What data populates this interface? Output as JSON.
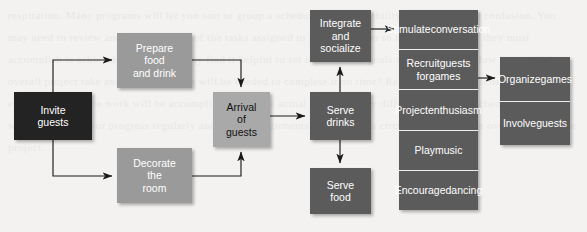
{
  "diagram": {
    "type": "flowchart",
    "canvas": {
      "width": 587,
      "height": 232,
      "background": "#f3f2f0"
    },
    "palette": {
      "near_black": "#232323",
      "medium_gray": "#9a9a9a",
      "light_gray": "#a9a9a9",
      "dark_gray": "#5b5b5b",
      "white_text": "#ffffff",
      "black_text": "#111111",
      "divider": "#efefef",
      "arrow": "#1a1a1a"
    },
    "background_bleed_text": "respiration. Many programs will let you sort or group a schedule by responsibility. This is to avoid confusion. You may need to review and coordinate all of the tasks assigned to a given person so that the work that they must accomplish is achievable. Also, you may find it helpful to set intermediate goals and milestones. How long will the overall project take and what resources will be needed to complete it on time? Remember that the schedule is only an estimate of how the work will be accomplished, and the actual sequence may differ. To make the schedule work, you will need to monitor progress regularly and adjust assignments and timing as circumstances change over the life of the project.",
    "nodes": [
      {
        "id": "invite-guests",
        "label": "Invite\nguests",
        "style": "near_black",
        "text": "white",
        "x": 14,
        "y": 92,
        "w": 78,
        "h": 48
      },
      {
        "id": "prepare-food",
        "label": "Prepare\nfood\nand drink",
        "style": "medium_gray",
        "text": "white",
        "x": 117,
        "y": 33,
        "w": 75,
        "h": 55
      },
      {
        "id": "decorate-room",
        "label": "Decorate\nthe\nroom",
        "style": "medium_gray",
        "text": "white",
        "x": 117,
        "y": 148,
        "w": 75,
        "h": 55
      },
      {
        "id": "arrival-of-guests",
        "label": "Arrival\nof\nguests",
        "style": "light_gray",
        "text": "black",
        "x": 213,
        "y": 92,
        "w": 57,
        "h": 55
      },
      {
        "id": "integrate-socialize",
        "label": "Integrate\nand\nsocialize",
        "style": "dark_gray",
        "text": "white",
        "x": 310,
        "y": 10,
        "w": 61,
        "h": 52
      },
      {
        "id": "serve-drinks",
        "label": "Serve\ndrinks",
        "style": "dark_gray",
        "text": "white",
        "x": 310,
        "y": 92,
        "w": 61,
        "h": 48
      },
      {
        "id": "serve-food",
        "label": "Serve\nfood",
        "style": "dark_gray",
        "text": "white",
        "x": 310,
        "y": 168,
        "w": 61,
        "h": 46
      }
    ],
    "stacks": [
      {
        "id": "socialize-tactics",
        "style": "dark_gray",
        "x": 399,
        "y": 10,
        "w": 79,
        "h": 200,
        "cells": [
          {
            "id": "stimulate-conversation",
            "label": "Stimulate\nconversation"
          },
          {
            "id": "recruit-guests-games",
            "label": "Recruit\nguests for\ngames"
          },
          {
            "id": "project-enthusiasm",
            "label": "Project\nenthusiasm"
          },
          {
            "id": "play-music",
            "label": "Play\nmusic"
          },
          {
            "id": "encourage-dancing",
            "label": "Encourage\ndancing"
          }
        ]
      },
      {
        "id": "games-tactics",
        "style": "dark_gray",
        "x": 500,
        "y": 57,
        "w": 70,
        "h": 88,
        "cells": [
          {
            "id": "organize-games",
            "label": "Organize\ngames"
          },
          {
            "id": "involve-guests",
            "label": "Involve\nguests"
          }
        ]
      }
    ],
    "connectors": [
      {
        "id": "invite-to-prepare",
        "from": "invite-guests",
        "to": "prepare-food",
        "path": "M 53 92 L 53 60 L 112 60",
        "arrow": "right"
      },
      {
        "id": "invite-to-decorate",
        "from": "invite-guests",
        "to": "decorate-room",
        "path": "M 53 140 L 53 176 L 112 176",
        "arrow": "right"
      },
      {
        "id": "prepare-to-arrival",
        "from": "prepare-food",
        "to": "arrival-of-guests",
        "path": "M 192 60 L 241 60 L 241 87",
        "arrow": "down"
      },
      {
        "id": "decorate-to-arrival",
        "from": "decorate-room",
        "to": "arrival-of-guests",
        "path": "M 192 176 L 241 176 L 241 152",
        "arrow": "up"
      },
      {
        "id": "arrival-to-drinks",
        "from": "arrival-of-guests",
        "to": "serve-drinks",
        "path": "M 270 116 L 305 116",
        "arrow": "right"
      },
      {
        "id": "drinks-to-integrate",
        "from": "serve-drinks",
        "to": "integrate-socialize",
        "path": "M 340 92 L 340 67",
        "arrow": "up"
      },
      {
        "id": "drinks-to-food",
        "from": "serve-drinks",
        "to": "serve-food",
        "path": "M 340 140 L 340 163",
        "arrow": "down"
      },
      {
        "id": "integrate-to-stack",
        "from": "integrate-socialize",
        "to": "stimulate-conversation",
        "path": "M 371 29 L 394 29",
        "arrow": "right"
      },
      {
        "id": "recruit-to-organize",
        "from": "recruit-guests-games",
        "to": "organize-games",
        "path": "M 478 78 L 495 78",
        "arrow": "right"
      }
    ]
  }
}
